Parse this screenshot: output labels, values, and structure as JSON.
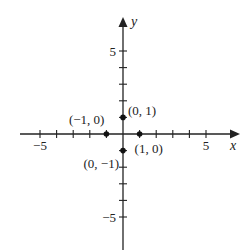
{
  "chart_data": {
    "type": "scatter",
    "title": "",
    "xlabel": "x",
    "ylabel": "y",
    "xlim": [
      -6,
      7
    ],
    "ylim": [
      -6,
      7
    ],
    "grid": false,
    "ticks": {
      "x": [
        -5,
        -4,
        -3,
        -2,
        -1,
        1,
        2,
        3,
        4,
        5
      ],
      "y": [
        -5,
        -4,
        -3,
        -2,
        -1,
        1,
        2,
        3,
        4,
        5
      ]
    },
    "tick_labels": {
      "x": [
        {
          "value": -5,
          "label": "−5"
        },
        {
          "value": 5,
          "label": "5"
        }
      ],
      "y": [
        {
          "value": 5,
          "label": "5"
        },
        {
          "value": -5,
          "label": "−5"
        }
      ]
    },
    "points": [
      {
        "x": 0,
        "y": 1,
        "label": "(0, 1)"
      },
      {
        "x": -1,
        "y": 0,
        "label": "(−1, 0)"
      },
      {
        "x": 1,
        "y": 0,
        "label": "(1, 0)"
      },
      {
        "x": 0,
        "y": -1,
        "label": "(0, −1)"
      }
    ]
  },
  "colors": {
    "axis": "#222222",
    "point": "#111111",
    "background": "#ffffff"
  }
}
